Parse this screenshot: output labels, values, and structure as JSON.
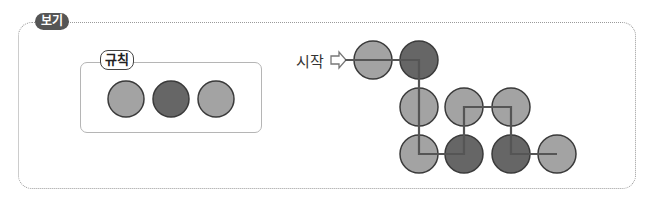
{
  "badge": {
    "label": "보기"
  },
  "rule": {
    "label": "규칙",
    "circles": [
      {
        "cx": 126,
        "cy": 99,
        "shade": "light"
      },
      {
        "cx": 171,
        "cy": 99,
        "shade": "dark"
      },
      {
        "cx": 216,
        "cy": 99,
        "shade": "light"
      }
    ]
  },
  "start": {
    "label": "시작",
    "arrow_icon": "hollow-right-arrow"
  },
  "colors": {
    "light": "#a3a3a3",
    "dark": "#666666",
    "outline": "#3a3a3a",
    "path": "#555555",
    "border": "#9a9a9a"
  },
  "grid": {
    "radius": 19,
    "circles": [
      {
        "row": 1,
        "cx": 373,
        "cy": 60,
        "shade": "light"
      },
      {
        "row": 1,
        "cx": 419,
        "cy": 60,
        "shade": "dark"
      },
      {
        "row": 2,
        "cx": 419,
        "cy": 107,
        "shade": "light"
      },
      {
        "row": 2,
        "cx": 464,
        "cy": 107,
        "shade": "light"
      },
      {
        "row": 2,
        "cx": 511,
        "cy": 107,
        "shade": "light"
      },
      {
        "row": 3,
        "cx": 419,
        "cy": 154,
        "shade": "light"
      },
      {
        "row": 3,
        "cx": 464,
        "cy": 154,
        "shade": "dark"
      },
      {
        "row": 3,
        "cx": 511,
        "cy": 154,
        "shade": "dark"
      },
      {
        "row": 3,
        "cx": 557,
        "cy": 154,
        "shade": "light"
      }
    ],
    "path": [
      [
        345,
        60
      ],
      [
        419,
        60
      ],
      [
        419,
        154
      ],
      [
        464,
        154
      ],
      [
        464,
        107
      ],
      [
        511,
        107
      ],
      [
        511,
        154
      ],
      [
        557,
        154
      ]
    ]
  }
}
